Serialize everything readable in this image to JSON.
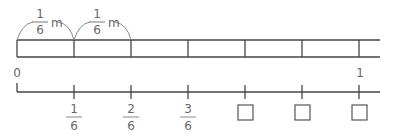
{
  "tape": {
    "segment_label_numerator": "1",
    "segment_label_denominator": "6",
    "segment_label_unit": "m",
    "segments": 6
  },
  "number_line": {
    "start_label": "0",
    "end_label": "1",
    "ticks": [
      {
        "numerator": "1",
        "denominator": "6"
      },
      {
        "numerator": "2",
        "denominator": "6"
      },
      {
        "numerator": "3",
        "denominator": "6"
      }
    ],
    "answer_boxes": 3
  }
}
